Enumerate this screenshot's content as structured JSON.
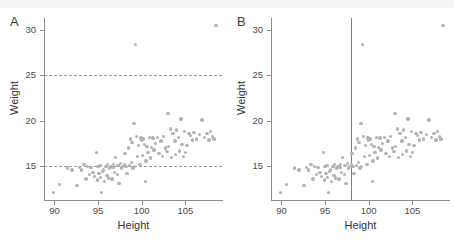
{
  "figure": {
    "background": "#ffffff",
    "point_color": "#b3b3b3",
    "axis_color": "#8c8c8c",
    "refline_color": "#9a9a9a"
  },
  "panels": [
    {
      "label": "A"
    },
    {
      "label": "B"
    }
  ],
  "chart_data": [
    {
      "type": "scatter",
      "panel": "A",
      "title": "",
      "xlabel": "Height",
      "ylabel": "Weight",
      "xlim": [
        88.8,
        109.2
      ],
      "ylim": [
        11.3,
        31.3
      ],
      "xticks": [
        90,
        95,
        100,
        105
      ],
      "yticks": [
        15,
        20,
        25,
        30
      ],
      "grid": false,
      "legend": "none",
      "reference_lines": [
        {
          "orientation": "horizontal",
          "value": 25,
          "style": "dashed"
        },
        {
          "orientation": "horizontal",
          "value": 15,
          "style": "dashed"
        }
      ],
      "x": [
        89.9,
        90.6,
        91.5,
        92.0,
        92.6,
        92.9,
        93.1,
        93.4,
        93.6,
        93.8,
        94.0,
        94.2,
        94.4,
        94.6,
        94.8,
        94.9,
        95.0,
        95.1,
        95.2,
        95.3,
        95.4,
        95.5,
        95.6,
        95.7,
        95.9,
        96.0,
        96.1,
        96.2,
        96.3,
        96.5,
        96.6,
        96.7,
        96.8,
        96.9,
        97.0,
        97.2,
        97.3,
        97.4,
        97.6,
        97.7,
        97.8,
        98.0,
        98.1,
        98.2,
        98.3,
        98.5,
        98.6,
        98.7,
        98.8,
        98.9,
        99.0,
        99.1,
        99.2,
        99.3,
        99.4,
        99.5,
        99.6,
        99.8,
        99.9,
        100.0,
        100.1,
        100.2,
        100.3,
        100.4,
        100.5,
        100.6,
        100.7,
        100.9,
        101.0,
        101.1,
        101.3,
        101.4,
        101.6,
        101.8,
        102.0,
        102.2,
        102.4,
        102.5,
        102.7,
        102.9,
        103.0,
        103.1,
        103.3,
        103.4,
        103.6,
        103.8,
        103.9,
        104.0,
        104.2,
        104.3,
        104.5,
        104.6,
        104.8,
        104.9,
        105.0,
        105.2,
        105.4,
        105.6,
        105.8,
        106.0,
        106.3,
        106.6,
        106.9,
        107.2,
        107.5,
        107.7,
        107.9,
        108.1,
        108.3,
        108.5
      ],
      "y": [
        12.1,
        13.0,
        14.8,
        14.6,
        12.9,
        14.9,
        14.6,
        15.2,
        13.6,
        15.0,
        14.1,
        14.9,
        14.3,
        13.9,
        16.5,
        13.5,
        15.0,
        14.2,
        15.1,
        13.8,
        12.1,
        14.4,
        14.6,
        13.3,
        15.0,
        14.0,
        15.2,
        13.7,
        14.8,
        15.0,
        13.6,
        14.9,
        15.2,
        14.3,
        16.0,
        14.1,
        15.1,
        13.1,
        15.3,
        14.8,
        15.0,
        15.2,
        16.4,
        15.0,
        14.2,
        17.0,
        15.1,
        18.0,
        15.4,
        17.6,
        14.8,
        19.7,
        15.0,
        28.4,
        18.3,
        16.1,
        17.3,
        15.2,
        18.1,
        17.9,
        16.2,
        18.0,
        17.4,
        13.3,
        15.6,
        17.2,
        16.5,
        18.2,
        15.9,
        17.1,
        18.1,
        16.8,
        17.5,
        18.2,
        16.4,
        17.8,
        16.1,
        18.3,
        17.0,
        16.6,
        20.8,
        17.2,
        19.1,
        16.0,
        18.6,
        17.8,
        16.3,
        19.0,
        18.2,
        16.7,
        20.2,
        17.4,
        16.1,
        18.8,
        16.5,
        17.3,
        18.6,
        18.4,
        17.9,
        18.7,
        18.0,
        18.5,
        20.1,
        18.2,
        18.6,
        17.9,
        18.8,
        18.3,
        18.0,
        30.5
      ]
    },
    {
      "type": "scatter",
      "panel": "B",
      "title": "",
      "xlabel": "Height",
      "ylabel": "Weight",
      "xlim": [
        88.8,
        109.2
      ],
      "ylim": [
        11.3,
        31.3
      ],
      "xticks": [
        90,
        95,
        100,
        105
      ],
      "yticks": [
        15,
        20,
        25,
        30
      ],
      "grid": false,
      "legend": "none",
      "reference_lines": [
        {
          "orientation": "vertical",
          "value": 98,
          "style": "solid"
        }
      ],
      "x": [
        89.9,
        90.6,
        91.5,
        92.0,
        92.6,
        92.9,
        93.1,
        93.4,
        93.6,
        93.8,
        94.0,
        94.2,
        94.4,
        94.6,
        94.8,
        94.9,
        95.0,
        95.1,
        95.2,
        95.3,
        95.4,
        95.5,
        95.6,
        95.7,
        95.9,
        96.0,
        96.1,
        96.2,
        96.3,
        96.5,
        96.6,
        96.7,
        96.8,
        96.9,
        97.0,
        97.2,
        97.3,
        97.4,
        97.6,
        97.7,
        97.8,
        98.0,
        98.1,
        98.2,
        98.3,
        98.5,
        98.6,
        98.7,
        98.8,
        98.9,
        99.0,
        99.1,
        99.2,
        99.3,
        99.4,
        99.5,
        99.6,
        99.8,
        99.9,
        100.0,
        100.1,
        100.2,
        100.3,
        100.4,
        100.5,
        100.6,
        100.7,
        100.9,
        101.0,
        101.1,
        101.3,
        101.4,
        101.6,
        101.8,
        102.0,
        102.2,
        102.4,
        102.5,
        102.7,
        102.9,
        103.0,
        103.1,
        103.3,
        103.4,
        103.6,
        103.8,
        103.9,
        104.0,
        104.2,
        104.3,
        104.5,
        104.6,
        104.8,
        104.9,
        105.0,
        105.2,
        105.4,
        105.6,
        105.8,
        106.0,
        106.3,
        106.6,
        106.9,
        107.2,
        107.5,
        107.7,
        107.9,
        108.1,
        108.3,
        108.5
      ],
      "y": [
        12.1,
        13.0,
        14.8,
        14.6,
        12.9,
        14.9,
        14.6,
        15.2,
        13.6,
        15.0,
        14.1,
        14.9,
        14.3,
        13.9,
        16.5,
        13.5,
        15.0,
        14.2,
        15.1,
        13.8,
        12.1,
        14.4,
        14.6,
        13.3,
        15.0,
        14.0,
        15.2,
        13.7,
        14.8,
        15.0,
        13.6,
        14.9,
        15.2,
        14.3,
        16.0,
        14.1,
        15.1,
        13.1,
        15.3,
        14.8,
        15.0,
        15.2,
        16.4,
        15.0,
        14.2,
        17.0,
        15.1,
        18.0,
        15.4,
        17.6,
        14.8,
        19.7,
        15.0,
        28.4,
        18.3,
        16.1,
        17.3,
        15.2,
        18.1,
        17.9,
        16.2,
        18.0,
        17.4,
        13.3,
        15.6,
        17.2,
        16.5,
        18.2,
        15.9,
        17.1,
        18.1,
        16.8,
        17.5,
        18.2,
        16.4,
        17.8,
        16.1,
        18.3,
        17.0,
        16.6,
        20.8,
        17.2,
        19.1,
        16.0,
        18.6,
        17.8,
        16.3,
        19.0,
        18.2,
        16.7,
        20.2,
        17.4,
        16.1,
        18.8,
        16.5,
        17.3,
        18.6,
        18.4,
        17.9,
        18.7,
        18.0,
        18.5,
        20.1,
        18.2,
        18.6,
        17.9,
        18.8,
        18.3,
        18.0,
        30.5
      ]
    }
  ]
}
